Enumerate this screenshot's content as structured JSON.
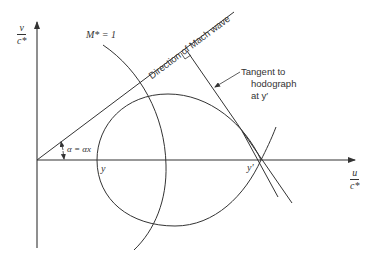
{
  "figure": {
    "axes": {
      "y_label_num": "v",
      "y_label_den": "c*",
      "x_label_num": "u",
      "x_label_den": "c*"
    },
    "labels": {
      "sonic_circle": "M* = 1",
      "mach_wave": "Direction of Mach wave",
      "tangent_line1": "Tangent to",
      "tangent_line2": "hodograph",
      "tangent_line3": "at y′",
      "angle": "α = αx",
      "point_y": "y",
      "point_y_prime": "y′"
    },
    "colors": {
      "ink": "#333333",
      "background": "#ffffff"
    }
  }
}
